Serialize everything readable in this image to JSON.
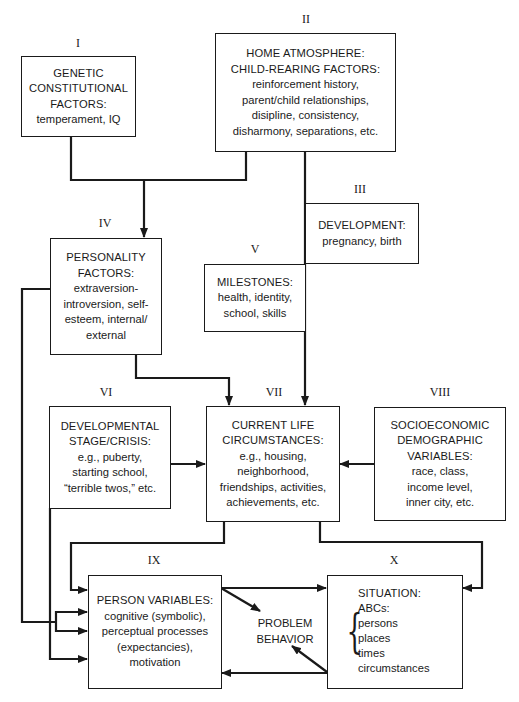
{
  "diagram": {
    "type": "flowchart"
  },
  "nodes": {
    "I": {
      "numeral": "I",
      "title": [
        "GENETIC",
        "CONSTITUTIONAL",
        "FACTORS:"
      ],
      "body": [
        "temperament, IQ"
      ]
    },
    "II": {
      "numeral": "II",
      "title": [
        "HOME ATMOSPHERE:",
        "CHILD-REARING FACTORS:"
      ],
      "body": [
        "reinforcement history,",
        "parent/child relationships,",
        "disipline, consistency,",
        "disharmony, separations, etc."
      ]
    },
    "III": {
      "numeral": "III",
      "title": [
        "DEVELOPMENT:"
      ],
      "body": [
        "pregnancy, birth"
      ]
    },
    "IV": {
      "numeral": "IV",
      "title": [
        "PERSONALITY",
        "FACTORS:"
      ],
      "body": [
        "extraversion-",
        "introversion, self-",
        "esteem, internal/",
        "external"
      ]
    },
    "V": {
      "numeral": "V",
      "title": [
        "MILESTONES:"
      ],
      "body": [
        "health, identity,",
        "school, skills"
      ]
    },
    "VI": {
      "numeral": "VI",
      "title": [
        "DEVELOPMENTAL",
        "STAGE/CRISIS:"
      ],
      "body": [
        "e.g., puberty,",
        "starting school,",
        "“terrible twos,” etc."
      ]
    },
    "VII": {
      "numeral": "VII",
      "title": [
        "CURRENT LIFE",
        "CIRCUMSTANCES:"
      ],
      "body": [
        "e.g., housing,",
        "neighborhood,",
        "friendships, activities,",
        "achievements, etc."
      ]
    },
    "VIII": {
      "numeral": "VIII",
      "title": [
        "SOCIOECONOMIC",
        "DEMOGRAPHIC",
        "VARIABLES:"
      ],
      "body": [
        "race, class,",
        "income level,",
        "inner city, etc."
      ]
    },
    "IX": {
      "numeral": "IX",
      "title": [
        "PERSON VARIABLES:"
      ],
      "body": [
        "cognitive (symbolic),",
        "perceptual processes",
        "(expectancies),",
        "motivation"
      ]
    },
    "X": {
      "numeral": "X",
      "title": [
        "SITUATION:"
      ],
      "body": [
        "ABCs:",
        "persons",
        "places",
        "times",
        "circumstances"
      ]
    },
    "problem_behavior": {
      "label": [
        "PROBLEM",
        "BEHAVIOR"
      ]
    }
  },
  "edges": [
    {
      "from": "I",
      "to": "IV"
    },
    {
      "from": "II",
      "to": "IV"
    },
    {
      "from": "II",
      "to": "VII"
    },
    {
      "from": "IV",
      "to": "VII"
    },
    {
      "from": "IV",
      "to": "IX"
    },
    {
      "from": "VI",
      "to": "VII"
    },
    {
      "from": "VI",
      "to": "IX"
    },
    {
      "from": "VIII",
      "to": "VII"
    },
    {
      "from": "VII",
      "to": "IX"
    },
    {
      "from": "VII",
      "to": "X"
    },
    {
      "from": "IX",
      "to": "X"
    },
    {
      "from": "X",
      "to": "IX"
    },
    {
      "from": "IX",
      "to": "problem_behavior"
    },
    {
      "from": "X",
      "to": "problem_behavior"
    }
  ],
  "colors": {
    "line": "#1a1a1a",
    "background": "#ffffff"
  }
}
